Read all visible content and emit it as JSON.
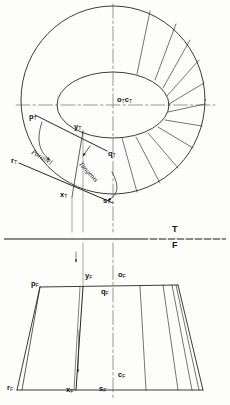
{
  "figure": {
    "type": "descriptive-geometry-drawing",
    "fold_line": {
      "top_label": "T",
      "front_label": "F"
    },
    "annotations": {
      "parallel": "Parallel",
      "tangents": "Tangents"
    },
    "top_view": {
      "points": [
        {
          "id": "o_T_c_T",
          "base": "o",
          "sub": "T",
          "base2": "c",
          "sub2": "T",
          "x": 118,
          "y": 100
        },
        {
          "id": "p_T",
          "base": "p",
          "sub": "T",
          "x": 29,
          "y": 118
        },
        {
          "id": "y_T",
          "base": "y",
          "sub": "T",
          "x": 76,
          "y": 128
        },
        {
          "id": "q_T",
          "base": "q",
          "sub": "T",
          "x": 109,
          "y": 155
        },
        {
          "id": "r_T",
          "base": "r",
          "sub": "T",
          "x": 13,
          "y": 163
        },
        {
          "id": "x_T",
          "base": "x",
          "sub": "T",
          "x": 62,
          "y": 196
        },
        {
          "id": "s_T",
          "base": "s",
          "sub": "T",
          "x": 104,
          "y": 202
        }
      ]
    },
    "front_view": {
      "points": [
        {
          "id": "p_F",
          "base": "p",
          "sub": "F",
          "x": 33,
          "y": 280
        },
        {
          "id": "y_F",
          "base": "y",
          "sub": "F",
          "x": 85,
          "y": 269
        },
        {
          "id": "o_F",
          "base": "o",
          "sub": "F",
          "x": 121,
          "y": 268
        },
        {
          "id": "q_F",
          "base": "q",
          "sub": "F",
          "x": 104,
          "y": 281
        },
        {
          "id": "c_F",
          "base": "c",
          "sub": "F",
          "x": 121,
          "y": 367
        },
        {
          "id": "r_F",
          "base": "r",
          "sub": "F",
          "x": 9,
          "y": 381
        },
        {
          "id": "x_F",
          "base": "x",
          "sub": "F",
          "x": 68,
          "y": 383
        },
        {
          "id": "s_F",
          "base": "s",
          "sub": "F",
          "x": 101,
          "y": 381
        }
      ]
    },
    "colors": {
      "line": "#1a1a1a",
      "center": "#555555",
      "paper": "#fdfdfb"
    }
  }
}
